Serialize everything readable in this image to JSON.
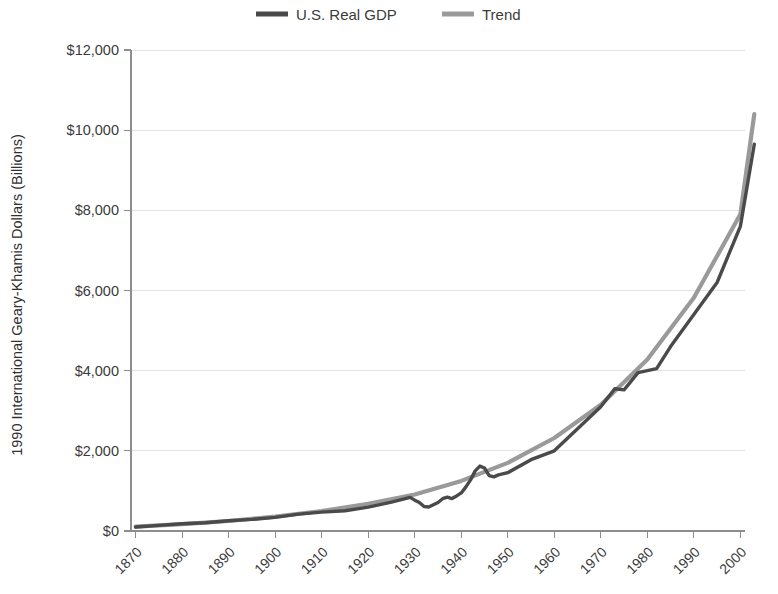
{
  "chart_data": {
    "type": "line",
    "title": "",
    "xlabel": "",
    "ylabel": "1990 International Geary-Khamis Dollars (Billions)",
    "xlim": [
      1869,
      2001
    ],
    "ylim": [
      0,
      12000
    ],
    "grid": true,
    "legend_position": "top-center",
    "x_ticks": [
      "1870",
      "1880",
      "1890",
      "1900",
      "1910",
      "1920",
      "1930",
      "1940",
      "1950",
      "1960",
      "1970",
      "1980",
      "1990",
      "2000"
    ],
    "y_ticks": [
      "$0",
      "$2,000",
      "$4,000",
      "$6,000",
      "$8,000",
      "$10,000",
      "$12,000"
    ],
    "y_tick_values": [
      0,
      2000,
      4000,
      6000,
      8000,
      10000,
      12000
    ],
    "colors": {
      "gdp": "#4a4a4a",
      "trend": "#9a9a9a",
      "grid": "#e2e2e2",
      "axis": "#8d8d8d",
      "text": "#3b3b3b",
      "background": "#ffffff"
    },
    "series": [
      {
        "name": "U.S. Real GDP",
        "color": "#4a4a4a",
        "x": [
          1870,
          1875,
          1880,
          1885,
          1890,
          1895,
          1900,
          1905,
          1910,
          1915,
          1920,
          1925,
          1929,
          1930,
          1931,
          1932,
          1933,
          1934,
          1935,
          1936,
          1937,
          1938,
          1939,
          1940,
          1941,
          1942,
          1943,
          1944,
          1945,
          1946,
          1947,
          1948,
          1950,
          1955,
          1960,
          1965,
          1970,
          1973,
          1975,
          1978,
          1980,
          1982,
          1985,
          1990,
          1995,
          2000,
          2003
        ],
        "y": [
          98,
          140,
          180,
          205,
          255,
          290,
          340,
          420,
          470,
          505,
          595,
          720,
          840,
          770,
          710,
          610,
          600,
          655,
          710,
          805,
          845,
          810,
          875,
          950,
          1100,
          1275,
          1500,
          1620,
          1570,
          1380,
          1350,
          1400,
          1455,
          1780,
          2000,
          2550,
          3100,
          3550,
          3520,
          3950,
          4000,
          4050,
          4600,
          5400,
          6200,
          7600,
          9650
        ]
      },
      {
        "name": "Trend",
        "color": "#9a9a9a",
        "x": [
          1870,
          1880,
          1890,
          1900,
          1910,
          1920,
          1930,
          1940,
          1950,
          1960,
          1970,
          1980,
          1990,
          2000,
          2003
        ],
        "y": [
          110,
          170,
          250,
          360,
          500,
          680,
          910,
          1250,
          1700,
          2320,
          3150,
          4280,
          5820,
          7900,
          10400
        ]
      }
    ],
    "annotations": []
  },
  "legend": {
    "items": [
      {
        "label": "U.S. Real GDP",
        "color": "#4a4a4a"
      },
      {
        "label": "Trend",
        "color": "#9a9a9a"
      }
    ]
  }
}
